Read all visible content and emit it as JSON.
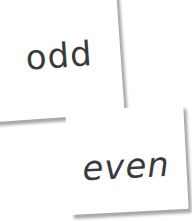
{
  "cards": [
    {
      "label": "odd"
    },
    {
      "label": "even"
    }
  ]
}
